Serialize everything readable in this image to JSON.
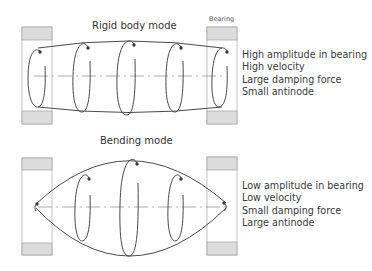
{
  "diagram": {
    "colors": {
      "line": "#4a4a4a",
      "bearing_fill": "#dcdcdc",
      "bearing_border": "#9a9a9a",
      "axis": "#8a8a8a",
      "text": "#3a3a3a"
    },
    "rigid_mode": {
      "title": "Rigid body mode",
      "bearing_label": "Bearing",
      "properties": [
        "High amplitude in bearing",
        "High velocity",
        "Large damping force",
        "Small antinode"
      ]
    },
    "bending_mode": {
      "title": "Bending mode",
      "properties": [
        "Low amplitude in bearing",
        "Low velocity",
        "Small damping force",
        "Large antinode"
      ]
    }
  }
}
